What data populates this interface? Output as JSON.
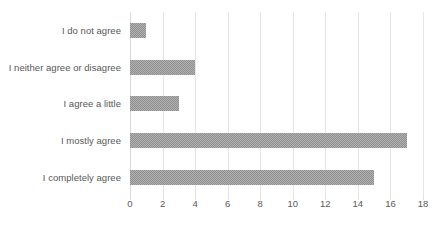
{
  "chart_data": {
    "type": "bar",
    "orientation": "horizontal",
    "title": "",
    "subtitle": "",
    "xlabel": "",
    "ylabel": "",
    "categories": [
      "I do not agree",
      "I neither agree or disagree",
      "I agree a little",
      "I mostly agree",
      "I completely agree"
    ],
    "values": [
      1,
      4,
      3,
      17,
      15
    ],
    "series": [
      {
        "name": "",
        "values": [
          1,
          4,
          3,
          17,
          15
        ]
      }
    ],
    "xlim": [
      0,
      18
    ],
    "ylim": null,
    "xticks": [
      0,
      2,
      4,
      6,
      8,
      10,
      12,
      14,
      16,
      18
    ],
    "xtick_labels": [
      "0",
      "2",
      "4",
      "6",
      "8",
      "10",
      "12",
      "14",
      "16",
      "18"
    ],
    "grid": "vertical-only",
    "legend": "none",
    "annotations": [],
    "colors": {
      "bar_fill": "#8f8f8f",
      "gridline": "#e6e6e6",
      "axis_line": "#d9d9d9",
      "text": "#595959",
      "background": "#ffffff"
    }
  }
}
